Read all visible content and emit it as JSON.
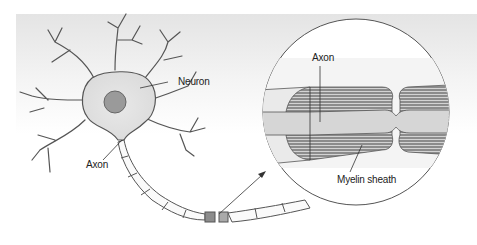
{
  "diagram": {
    "labels": {
      "neuron": "Neuron",
      "axon_left": "Axon",
      "axon_magnified": "Axon",
      "myelin": "Myelin sheath"
    },
    "colors": {
      "background_gradient_top": "#e6e6e6",
      "line": "#4a4a4a",
      "cell_fill": "#ececec",
      "nucleus": "#9a9a9a",
      "myelin_fill": "#8c8c8c",
      "axon_fill": "#d6d6d6"
    }
  }
}
